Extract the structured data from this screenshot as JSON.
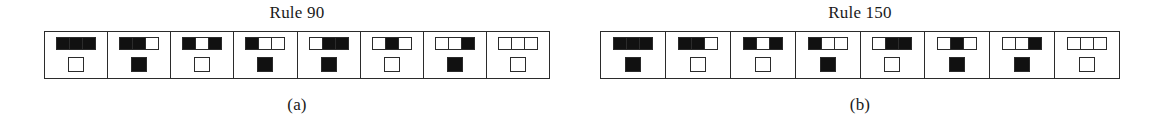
{
  "figure": {
    "background_color": "#ffffff",
    "ink_color": "#111111",
    "line_color": "#2b2b2b"
  },
  "panels": [
    {
      "title": "Rule 90",
      "caption": "(a)",
      "rule_number": 90,
      "cells": [
        {
          "neighborhood": [
            1,
            1,
            1
          ],
          "result": 0
        },
        {
          "neighborhood": [
            1,
            1,
            0
          ],
          "result": 1
        },
        {
          "neighborhood": [
            1,
            0,
            1
          ],
          "result": 0
        },
        {
          "neighborhood": [
            1,
            0,
            0
          ],
          "result": 1
        },
        {
          "neighborhood": [
            0,
            1,
            1
          ],
          "result": 1
        },
        {
          "neighborhood": [
            0,
            1,
            0
          ],
          "result": 0
        },
        {
          "neighborhood": [
            0,
            0,
            1
          ],
          "result": 1
        },
        {
          "neighborhood": [
            0,
            0,
            0
          ],
          "result": 0
        }
      ]
    },
    {
      "title": "Rule 150",
      "caption": "(b)",
      "rule_number": 150,
      "cells": [
        {
          "neighborhood": [
            1,
            1,
            1
          ],
          "result": 1
        },
        {
          "neighborhood": [
            1,
            1,
            0
          ],
          "result": 0
        },
        {
          "neighborhood": [
            1,
            0,
            1
          ],
          "result": 0
        },
        {
          "neighborhood": [
            1,
            0,
            0
          ],
          "result": 1
        },
        {
          "neighborhood": [
            0,
            1,
            1
          ],
          "result": 0
        },
        {
          "neighborhood": [
            0,
            1,
            0
          ],
          "result": 1
        },
        {
          "neighborhood": [
            0,
            0,
            1
          ],
          "result": 1
        },
        {
          "neighborhood": [
            0,
            0,
            0
          ],
          "result": 0
        }
      ]
    }
  ]
}
